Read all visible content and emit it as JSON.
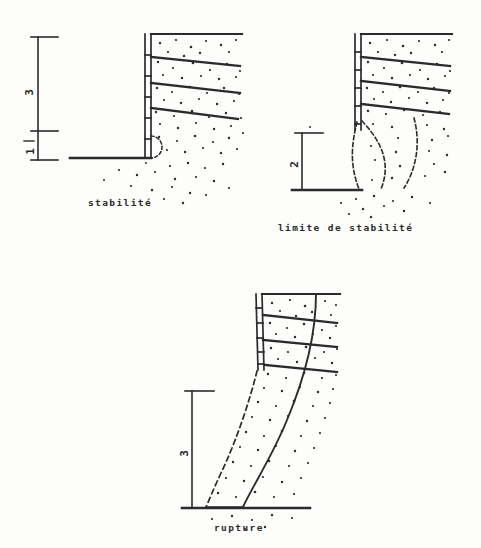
{
  "figure": {
    "title_implicit": "",
    "background_color": "#fdfdfc",
    "ink_color": "#2b2b2b"
  },
  "panels": [
    {
      "id": "panel-stabilite",
      "caption": "stabilité",
      "state": "stable",
      "scale_bar": {
        "segments": [
          {
            "label": "3",
            "position": "upper"
          },
          {
            "label": "1",
            "position": "lower"
          }
        ]
      },
      "wall": {
        "facing_panels": 6,
        "reinforcement_layers": 3,
        "failure_surface_style": "none"
      },
      "toe_arc": {
        "style": "dashed",
        "shape": "semicircle"
      }
    },
    {
      "id": "panel-limite-de-stabilite",
      "caption": "limite de stabilité",
      "state": "limit",
      "scale_bar": {
        "segments": [
          {
            "label": "2",
            "position": "full"
          }
        ]
      },
      "wall": {
        "facing_panels": 6,
        "reinforcement_layers": 3,
        "failure_surface_style": "dashed"
      },
      "failure_curves": 2
    },
    {
      "id": "panel-rupture",
      "caption": "rupture",
      "state": "ruptured",
      "scale_bar": {
        "segments": [
          {
            "label": "3",
            "position": "full"
          }
        ]
      },
      "wall": {
        "facing_panels": 6,
        "reinforcement_layers": 3,
        "failure_surface_style": "solid-and-dashed"
      },
      "failure_curves": 2
    }
  ],
  "legend_terms": {
    "stabilite": "stabilité",
    "limite": "limite de stabilité",
    "rupture": "rupture"
  }
}
